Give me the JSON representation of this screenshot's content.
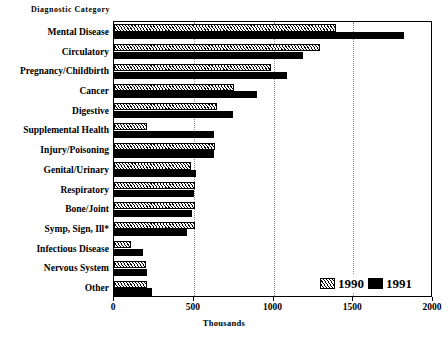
{
  "chart_data": {
    "type": "bar",
    "orientation": "horizontal",
    "title": "",
    "xlabel": "Thousands",
    "ylabel": "Diagnostic Category",
    "xlim": [
      0,
      2000
    ],
    "xticks": [
      0,
      500,
      1000,
      1500,
      2000
    ],
    "xticklabels": [
      "0",
      "500",
      "1000",
      "1500",
      "2000"
    ],
    "grid": true,
    "grid_axis": "x",
    "legend_position": "bottom-right",
    "categories": [
      "Mental Disease",
      "Circulatory",
      "Pregnancy/Childbirth",
      "Cancer",
      "Digestive",
      "Supplemental Health",
      "Injury/Poisoning",
      "Genital/Urinary",
      "Respiratory",
      "Bone/Joint",
      "Symp, Sign, Ill*",
      "Infectious Disease",
      "Nervous System",
      "Other"
    ],
    "series": [
      {
        "name": "1990",
        "color": "#ffffff",
        "pattern": "diagonal-hatch",
        "values": [
          1390,
          1290,
          985,
          750,
          645,
          205,
          635,
          485,
          510,
          510,
          505,
          105,
          200,
          205
        ]
      },
      {
        "name": "1991",
        "color": "#000000",
        "pattern": "solid",
        "values": [
          1820,
          1185,
          1085,
          895,
          745,
          630,
          630,
          515,
          500,
          492,
          460,
          180,
          208,
          240
        ]
      }
    ],
    "footnote": "*"
  },
  "legend": {
    "items": [
      {
        "label": "1990",
        "swatch": "hatched-swatch"
      },
      {
        "label": "1991",
        "swatch": "solid-swatch"
      }
    ]
  }
}
